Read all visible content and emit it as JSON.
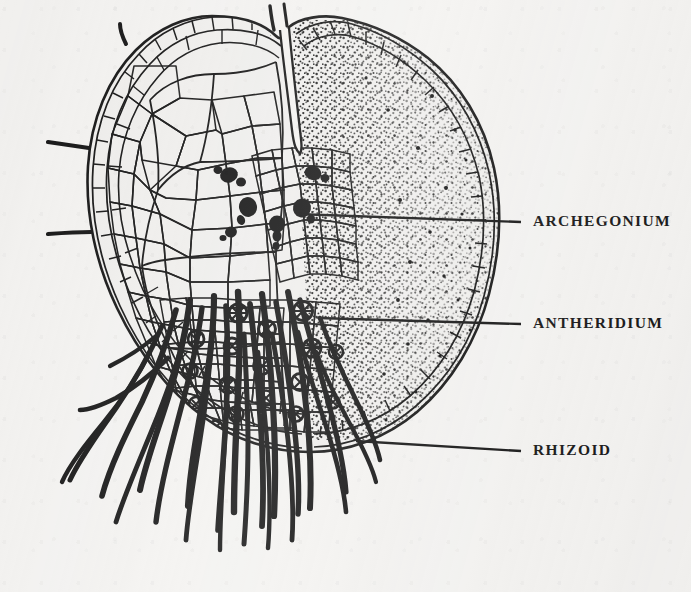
{
  "figure": {
    "background_color": "#f3f2f0",
    "ink_color": "#141414",
    "width": 691,
    "height": 592
  },
  "labels": [
    {
      "id": "archegonium",
      "text": "ARCHEGONIUM",
      "text_x": 533,
      "text_y": 222,
      "leader": {
        "x1": 296,
        "y1": 214,
        "x2": 521,
        "y2": 222
      },
      "points_to": "dark flask-shaped archegonia clustered just below the apical notch"
    },
    {
      "id": "antheridium",
      "text": "ANTHERIDIUM",
      "text_x": 533,
      "text_y": 324,
      "leader": {
        "x1": 318,
        "y1": 318,
        "x2": 521,
        "y2": 324
      },
      "points_to": "rounded segmented antheridia among the rhizoids on the lower cushion"
    },
    {
      "id": "rhizoid",
      "text": "RHIZOID",
      "text_x": 533,
      "text_y": 451,
      "leader": {
        "x1": 356,
        "y1": 441,
        "x2": 521,
        "y2": 451
      },
      "points_to": "thick dark unicellular filaments hanging from the ventral surface"
    }
  ],
  "structures": {
    "thallus": {
      "name": "heart-shaped (cordate) thallus",
      "notch": "apical sinus dividing the two lobes at the top centre",
      "left_lobe": "drawn as a network of polygonal cells with a border of smaller marginal cells",
      "right_lobe": "rendered with stippling, dense near the midrib and sparse toward the margin"
    },
    "marginal_hairs": 4,
    "archegonia_count": 7,
    "antheridia_count": 17,
    "rhizoid_count": 22
  }
}
